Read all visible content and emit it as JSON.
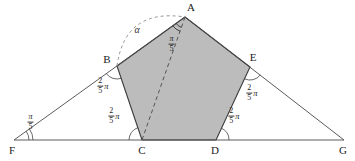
{
  "figure": {
    "colors": {
      "background": "#ffffff",
      "pentagon_fill": "#bcbcbc",
      "pentagon_stroke": "#3d3d3d",
      "line_stroke": "#4a4a4a",
      "dashed_stroke": "#777777"
    },
    "vertex_labels": {
      "A": "A",
      "B": "B",
      "C": "C",
      "D": "D",
      "E": "E",
      "F": "F",
      "G": "G"
    },
    "angles": {
      "alpha": "α",
      "A": {
        "num": "π",
        "den": "5",
        "suffix": ""
      },
      "B": {
        "num": "2",
        "den": "5",
        "suffix": "π"
      },
      "C": {
        "num": "2",
        "den": "5",
        "suffix": "π"
      },
      "D": {
        "num": "2",
        "den": "5",
        "suffix": "π"
      },
      "E": {
        "num": "2",
        "den": "5",
        "suffix": "π"
      },
      "F": {
        "num": "π",
        "den": "5",
        "suffix": ""
      }
    }
  }
}
